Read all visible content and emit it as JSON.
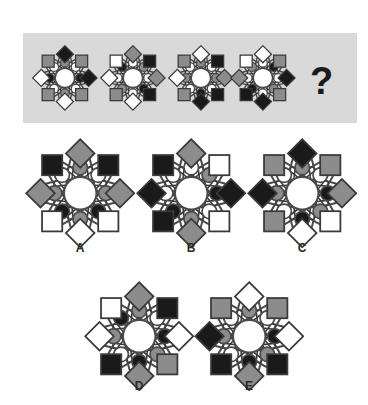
{
  "puzzle": {
    "type": "visual-analogy-matrix",
    "prompt_symbol": "?",
    "palette": {
      "panel_bg": "#d9d9d9",
      "page_bg": "#ffffff",
      "line": "#4a4a4a",
      "line_dark": "#3a3a3a",
      "fill_white": "#ffffff",
      "fill_gray": "#8c8c8c",
      "fill_black": "#1a1a1a",
      "center_fill": "#ffffff",
      "label_color": "#2b2b2b"
    },
    "panel": {
      "x": 23,
      "y": 33,
      "width": 334,
      "height": 90
    },
    "question_mark": {
      "x": 310,
      "y": 62,
      "label": "?"
    }
  },
  "sequence": {
    "name": "top-row-sequence",
    "count": 4,
    "items": [
      {
        "id": "seq-1",
        "name": "sequence-figure-1",
        "cx": 65,
        "cy": 78,
        "r": 28,
        "outer": [
          "black",
          "gray",
          "black",
          "gray",
          "white",
          "gray",
          "white",
          "gray"
        ],
        "inner": [
          "gray",
          "white",
          "black",
          "white",
          "gray",
          "white",
          "black",
          "white"
        ]
      },
      {
        "id": "seq-2",
        "name": "sequence-figure-2",
        "cx": 133,
        "cy": 78,
        "r": 28,
        "outer": [
          "gray",
          "black",
          "gray",
          "black",
          "white",
          "gray",
          "white",
          "white"
        ],
        "inner": [
          "white",
          "gray",
          "white",
          "black",
          "white",
          "gray",
          "white",
          "black"
        ]
      },
      {
        "id": "seq-3",
        "name": "sequence-figure-3",
        "cx": 201,
        "cy": 78,
        "r": 28,
        "outer": [
          "white",
          "black",
          "gray",
          "black",
          "black",
          "gray",
          "white",
          "gray"
        ],
        "inner": [
          "gray",
          "white",
          "gray",
          "white",
          "black",
          "white",
          "gray",
          "white"
        ]
      },
      {
        "id": "seq-4",
        "name": "sequence-figure-4",
        "cx": 263,
        "cy": 78,
        "r": 28,
        "outer": [
          "white",
          "gray",
          "black",
          "gray",
          "black",
          "black",
          "gray",
          "white"
        ],
        "inner": [
          "white",
          "black",
          "white",
          "gray",
          "white",
          "black",
          "white",
          "gray"
        ]
      }
    ]
  },
  "options": {
    "name": "answer-options",
    "count": 5,
    "items": [
      {
        "id": "A",
        "label": "A",
        "name": "option-a",
        "cx": 80,
        "cy": 193,
        "r": 47,
        "label_x": 68,
        "label_y": 242,
        "outer": [
          "gray",
          "black",
          "gray",
          "white",
          "white",
          "white",
          "gray",
          "black"
        ],
        "inner": [
          "gray",
          "white",
          "gray",
          "black",
          "gray",
          "black",
          "gray",
          "white"
        ]
      },
      {
        "id": "B",
        "label": "B",
        "name": "option-b",
        "cx": 191,
        "cy": 193,
        "r": 47,
        "label_x": 179,
        "label_y": 242,
        "outer": [
          "gray",
          "white",
          "black",
          "white",
          "gray",
          "black",
          "black",
          "black"
        ],
        "inner": [
          "white",
          "gray",
          "black",
          "white",
          "gray",
          "black",
          "white",
          "white"
        ]
      },
      {
        "id": "C",
        "label": "C",
        "name": "option-c",
        "cx": 302,
        "cy": 193,
        "r": 47,
        "label_x": 290,
        "label_y": 242,
        "outer": [
          "black",
          "gray",
          "gray",
          "white",
          "white",
          "gray",
          "black",
          "gray"
        ],
        "inner": [
          "gray",
          "white",
          "black",
          "gray",
          "black",
          "white",
          "gray",
          "white"
        ]
      },
      {
        "id": "D",
        "label": "D",
        "name": "option-d",
        "cx": 139,
        "cy": 336,
        "r": 47,
        "label_x": 127,
        "label_y": 380,
        "outer": [
          "gray",
          "black",
          "white",
          "gray",
          "gray",
          "black",
          "white",
          "white"
        ],
        "inner": [
          "gray",
          "white",
          "black",
          "gray",
          "black",
          "white",
          "gray",
          "black"
        ]
      },
      {
        "id": "E",
        "label": "E",
        "name": "option-e",
        "cx": 249,
        "cy": 336,
        "r": 47,
        "label_x": 237,
        "label_y": 380,
        "outer": [
          "white",
          "gray",
          "white",
          "black",
          "gray",
          "black",
          "black",
          "gray"
        ],
        "inner": [
          "gray",
          "white",
          "black",
          "gray",
          "black",
          "white",
          "gray",
          "white"
        ]
      }
    ]
  }
}
